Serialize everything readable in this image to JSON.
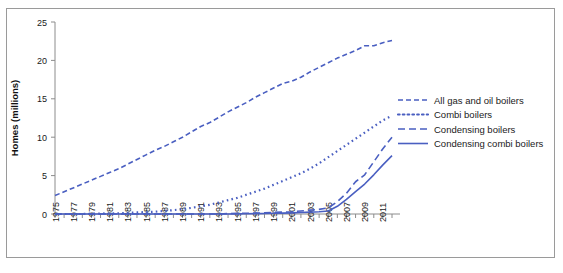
{
  "chart_data": {
    "type": "line",
    "title": "",
    "xlabel": "",
    "ylabel": "Homes (millions)",
    "ylim": [
      0,
      25
    ],
    "xlim": [
      1975,
      2012
    ],
    "yticks": [
      0,
      5,
      10,
      15,
      20,
      25
    ],
    "xticks": [
      1975,
      1977,
      1979,
      1981,
      1983,
      1985,
      1987,
      1989,
      1991,
      1993,
      1995,
      1997,
      1999,
      2001,
      2003,
      2005,
      2007,
      2009,
      2011
    ],
    "x_all": [
      1975,
      1976,
      1977,
      1978,
      1979,
      1980,
      1981,
      1982,
      1983,
      1984,
      1985,
      1986,
      1987,
      1988,
      1989,
      1990,
      1991,
      1992,
      1993,
      1994,
      1995,
      1996,
      1997,
      1998,
      1999,
      2000,
      2001,
      2002,
      2003,
      2004,
      2005,
      2006,
      2007,
      2008,
      2009,
      2010,
      2011,
      2012
    ],
    "grid": false,
    "legend_position": "right",
    "series_color": "#4a5fc1",
    "series": [
      {
        "name": "All gas and oil boilers",
        "dash_style": "short-dash",
        "values": [
          2.4,
          2.9,
          3.4,
          3.9,
          4.4,
          4.9,
          5.4,
          5.9,
          6.5,
          7.1,
          7.7,
          8.3,
          8.8,
          9.4,
          10.0,
          10.7,
          11.4,
          11.9,
          12.6,
          13.3,
          13.9,
          14.5,
          15.2,
          15.8,
          16.4,
          17.0,
          17.3,
          17.8,
          18.5,
          19.1,
          19.7,
          20.3,
          20.8,
          21.3,
          21.9,
          21.9,
          22.3,
          22.6
        ]
      },
      {
        "name": "Combi boilers",
        "dash_style": "dotted",
        "values": [
          0.0,
          0.0,
          0.0,
          0.0,
          0.05,
          0.05,
          0.1,
          0.1,
          0.15,
          0.2,
          0.25,
          0.3,
          0.4,
          0.5,
          0.65,
          0.8,
          1.0,
          1.2,
          1.5,
          1.8,
          2.1,
          2.5,
          2.9,
          3.3,
          3.8,
          4.3,
          4.8,
          5.3,
          5.9,
          6.6,
          7.4,
          8.2,
          9.0,
          9.8,
          10.6,
          11.4,
          12.2,
          12.8
        ]
      },
      {
        "name": "Condensing boilers",
        "dash_style": "long-dash",
        "values": [
          0.0,
          0.0,
          0.0,
          0.0,
          0.0,
          0.0,
          0.0,
          0.0,
          0.0,
          0.0,
          0.0,
          0.0,
          0.0,
          0.0,
          0.0,
          0.0,
          0.0,
          0.0,
          0.0,
          0.05,
          0.08,
          0.1,
          0.12,
          0.15,
          0.2,
          0.25,
          0.3,
          0.4,
          0.5,
          0.6,
          0.8,
          1.6,
          2.7,
          4.2,
          5.1,
          6.8,
          8.5,
          10.0
        ]
      },
      {
        "name": "Condensing combi boilers",
        "dash_style": "solid",
        "values": [
          0.0,
          0.0,
          0.0,
          0.0,
          0.0,
          0.0,
          0.0,
          0.0,
          0.0,
          0.0,
          0.0,
          0.0,
          0.0,
          0.0,
          0.0,
          0.0,
          0.0,
          0.0,
          0.0,
          0.0,
          0.02,
          0.03,
          0.05,
          0.07,
          0.1,
          0.12,
          0.15,
          0.2,
          0.25,
          0.3,
          0.4,
          1.0,
          1.9,
          2.9,
          3.9,
          5.1,
          6.4,
          7.6
        ]
      }
    ]
  }
}
